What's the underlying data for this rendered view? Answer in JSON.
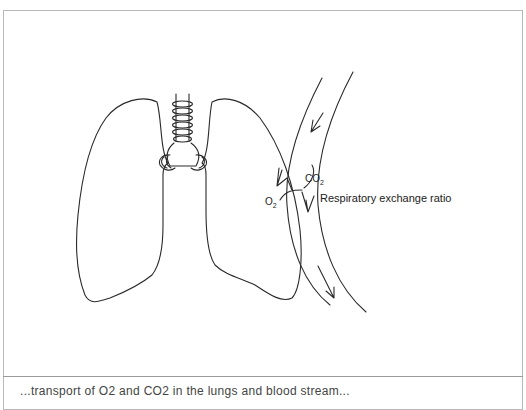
{
  "figure": {
    "label_exchange": "Respiratory exchange ratio",
    "co2_text": "CO",
    "co2_sub": "2",
    "o2_text": "O",
    "o2_sub": "2",
    "caption_partial": "...transport of O2 and CO2 in the lungs and blood stream...",
    "colors": {
      "line": "#2a2a2a",
      "frame": "#b8b8b8",
      "background": "#ffffff"
    }
  }
}
